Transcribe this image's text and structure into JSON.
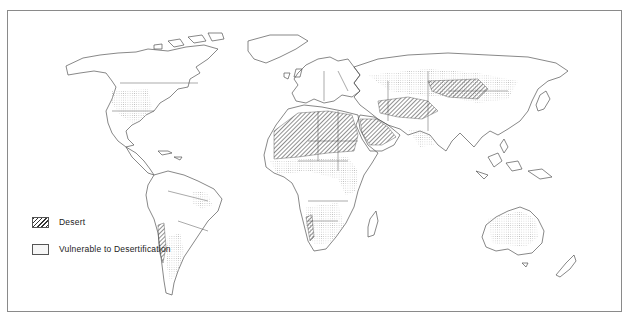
{
  "map": {
    "subject": "World map of deserts and areas vulnerable to desertification",
    "projection": "world outline with country borders",
    "colors": {
      "border": "#8a8a8a",
      "outline": "#444444",
      "desert_hatch": "#333333",
      "vulnerable_dots": "#c8c8c8",
      "background": "#ffffff"
    },
    "regions": {
      "desert": [
        "Sahara",
        "Arabian Peninsula",
        "Iran / Afghanistan / Pakistan",
        "Central Asia (Taklamakan / Gobi)",
        "Atacama (western South America)",
        "Namib (southwest Africa)"
      ],
      "vulnerable": [
        "Western United States / Mexico",
        "Northeast Brazil",
        "Patagonia / Argentina",
        "Sahel",
        "East Africa / Horn of Africa",
        "Southern Africa",
        "Central Asia / Kazakhstan",
        "Mongolia / Northern China",
        "India (northwest)",
        "Australia"
      ]
    }
  },
  "legend": {
    "items": [
      {
        "label": "Desert",
        "pattern": "hatched"
      },
      {
        "label": "Vulnerable to Desertification",
        "pattern": "dotted"
      }
    ]
  }
}
